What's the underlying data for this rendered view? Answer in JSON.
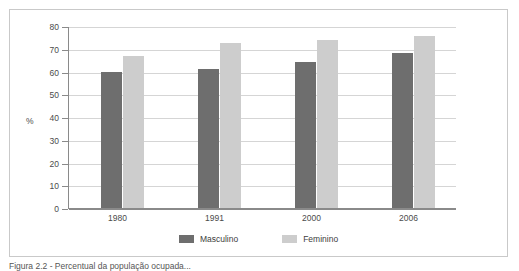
{
  "figure": {
    "caption": "Figura 2.2 - Percentual da população ocupada..."
  },
  "legend": {
    "position": "bottom-center",
    "items": [
      {
        "label": "Masculino",
        "color": "#6e6e6e"
      },
      {
        "label": "Feminino",
        "color": "#cdcdcd"
      }
    ]
  },
  "chart_data": {
    "type": "bar",
    "title": "",
    "xlabel": "",
    "ylabel": "%",
    "ylim": [
      0,
      80
    ],
    "ytick_step": 10,
    "yticks": [
      80,
      70,
      60,
      50,
      40,
      30,
      20,
      10,
      0
    ],
    "grid": true,
    "grid_axis": "y",
    "legend_position": "bottom-center",
    "categories": [
      "1980",
      "1991",
      "2000",
      "2006"
    ],
    "series": [
      {
        "name": "Masculino",
        "color": "#6e6e6e",
        "values": [
          60,
          61,
          64,
          68
        ]
      },
      {
        "name": "Feminino",
        "color": "#cdcdcd",
        "values": [
          67,
          72.5,
          74,
          75.5
        ]
      }
    ]
  }
}
